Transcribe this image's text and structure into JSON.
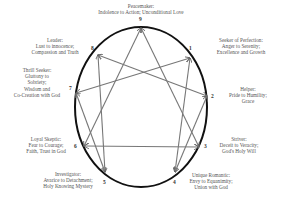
{
  "diagram": {
    "line_color": "#777777",
    "circle_color": "#111111",
    "points": [
      {
        "num": "9",
        "x": 141,
        "y": 28,
        "label": [
          "Peacemaker:",
          "Indolence to Action; Unconditional Love"
        ]
      },
      {
        "num": "1",
        "x": 190,
        "y": 58,
        "label": [
          "Seeker of Perfection:",
          "Anger to Serenity;",
          "Excellence and Growth"
        ]
      },
      {
        "num": "2",
        "x": 207,
        "y": 96,
        "label": [
          "Helper:",
          "Pride to Humility;",
          "Grace"
        ]
      },
      {
        "num": "3",
        "x": 199,
        "y": 147,
        "label": [
          "Striver:",
          "Deceit to Veracity;",
          "God's Holy Will"
        ]
      },
      {
        "num": "4",
        "x": 175,
        "y": 172,
        "label": [
          "Unique Romantic:",
          "Envy to Equanimity;",
          "Union with God"
        ]
      },
      {
        "num": "5",
        "x": 105,
        "y": 172,
        "label": [
          "Investigator:",
          "Avarice to Detachment;",
          "Holy Knowing Mystery"
        ]
      },
      {
        "num": "6",
        "x": 84,
        "y": 146,
        "label": [
          "Loyal Skeptic:",
          "Fear to Courage;",
          "Faith, Trust in God"
        ]
      },
      {
        "num": "7",
        "x": 76,
        "y": 93,
        "label": [
          "Thrill Seeker:",
          "Gluttony to",
          "Sobriety;",
          "Wisdom and",
          "Co-Creation with God"
        ]
      },
      {
        "num": "8",
        "x": 98,
        "y": 55,
        "label": [
          "Leader:",
          "Lust to innocence;",
          "Compassion and Truth"
        ]
      }
    ],
    "connections": [
      {
        "from": "1",
        "to": "7"
      },
      {
        "from": "7",
        "to": "5"
      },
      {
        "from": "5",
        "to": "8"
      },
      {
        "from": "8",
        "to": "2"
      },
      {
        "from": "2",
        "to": "4"
      },
      {
        "from": "4",
        "to": "1"
      },
      {
        "from": "9",
        "to": "3"
      },
      {
        "from": "3",
        "to": "6"
      },
      {
        "from": "6",
        "to": "9"
      }
    ]
  }
}
